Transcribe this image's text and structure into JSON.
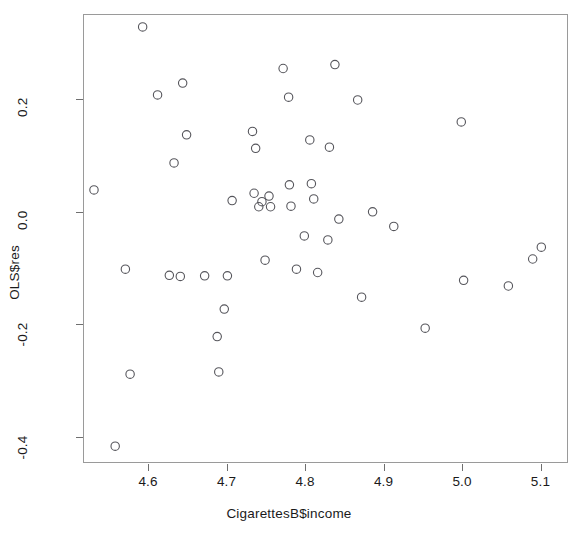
{
  "chart_data": {
    "type": "scatter",
    "title": "",
    "xlabel": "CigarettesB$income",
    "ylabel": "OLS$res",
    "xlim": [
      4.517,
      5.135
    ],
    "ylim": [
      -0.447,
      0.352
    ],
    "grid": false,
    "legend": null,
    "marker": {
      "shape": "open-circle",
      "color": "#55555b",
      "fill": "none",
      "radius_px": 4.2,
      "stroke_px": 1.1
    },
    "xticks": [
      4.6,
      4.7,
      4.8,
      4.9,
      5.0,
      5.1
    ],
    "xticklabels": [
      "4.6",
      "4.7",
      "4.8",
      "4.9",
      "5.0",
      "5.1"
    ],
    "yticks": [
      0.2,
      0.0,
      -0.2,
      -0.4
    ],
    "yticklabels": [
      "0.2",
      "0.0",
      "-0.2",
      "-0.4"
    ],
    "n_points": 51,
    "points": [
      {
        "x": 4.531,
        "y": 0.039
      },
      {
        "x": 4.558,
        "y": -0.417
      },
      {
        "x": 4.571,
        "y": -0.102
      },
      {
        "x": 4.577,
        "y": -0.289
      },
      {
        "x": 4.593,
        "y": 0.329
      },
      {
        "x": 4.612,
        "y": 0.208
      },
      {
        "x": 4.627,
        "y": -0.113
      },
      {
        "x": 4.633,
        "y": 0.087
      },
      {
        "x": 4.641,
        "y": -0.115
      },
      {
        "x": 4.644,
        "y": 0.229
      },
      {
        "x": 4.649,
        "y": 0.137
      },
      {
        "x": 4.672,
        "y": -0.114
      },
      {
        "x": 4.688,
        "y": -0.222
      },
      {
        "x": 4.69,
        "y": -0.285
      },
      {
        "x": 4.697,
        "y": -0.173
      },
      {
        "x": 4.701,
        "y": -0.114
      },
      {
        "x": 4.707,
        "y": 0.02
      },
      {
        "x": 4.733,
        "y": 0.143
      },
      {
        "x": 4.735,
        "y": 0.033
      },
      {
        "x": 4.737,
        "y": 0.113
      },
      {
        "x": 4.741,
        "y": 0.009
      },
      {
        "x": 4.745,
        "y": 0.018
      },
      {
        "x": 4.749,
        "y": -0.086
      },
      {
        "x": 4.754,
        "y": 0.028
      },
      {
        "x": 4.756,
        "y": 0.009
      },
      {
        "x": 4.772,
        "y": 0.255
      },
      {
        "x": 4.779,
        "y": 0.204
      },
      {
        "x": 4.78,
        "y": 0.048
      },
      {
        "x": 4.782,
        "y": 0.01
      },
      {
        "x": 4.789,
        "y": -0.102
      },
      {
        "x": 4.799,
        "y": -0.043
      },
      {
        "x": 4.806,
        "y": 0.128
      },
      {
        "x": 4.808,
        "y": 0.05
      },
      {
        "x": 4.811,
        "y": 0.023
      },
      {
        "x": 4.816,
        "y": -0.108
      },
      {
        "x": 4.829,
        "y": -0.05
      },
      {
        "x": 4.831,
        "y": 0.115
      },
      {
        "x": 4.838,
        "y": 0.262
      },
      {
        "x": 4.843,
        "y": -0.013
      },
      {
        "x": 4.867,
        "y": 0.199
      },
      {
        "x": 4.872,
        "y": -0.152
      },
      {
        "x": 4.886,
        "y": 0.0
      },
      {
        "x": 4.913,
        "y": -0.026
      },
      {
        "x": 4.953,
        "y": -0.207
      },
      {
        "x": 4.999,
        "y": 0.16
      },
      {
        "x": 5.002,
        "y": -0.122
      },
      {
        "x": 5.059,
        "y": -0.132
      },
      {
        "x": 5.09,
        "y": -0.084
      },
      {
        "x": 5.101,
        "y": -0.063
      }
    ]
  }
}
